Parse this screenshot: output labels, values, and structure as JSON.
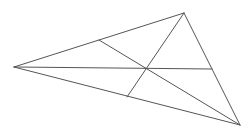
{
  "diagram": {
    "type": "triangle-with-concurrent-cevians",
    "width": 249,
    "height": 130,
    "background": "#ffffff",
    "stroke_color": "#555555",
    "stroke_width": 1,
    "vertices": {
      "A": {
        "x": 14,
        "y": 67
      },
      "B": {
        "x": 184,
        "y": 13
      },
      "C": {
        "x": 240,
        "y": 125
      }
    },
    "cevian_feet": {
      "D_on_AB": {
        "x": 99,
        "y": 40
      },
      "E_on_BC": {
        "x": 212,
        "y": 69
      },
      "F_on_CA": {
        "x": 127,
        "y": 97
      }
    },
    "concurrency_point": {
      "x": 146,
      "y": 68
    },
    "segments": [
      {
        "name": "side-ab",
        "from": "A",
        "to": "B"
      },
      {
        "name": "side-bc",
        "from": "B",
        "to": "C"
      },
      {
        "name": "side-ca",
        "from": "C",
        "to": "A"
      },
      {
        "name": "cevian-a-to-bc",
        "from": "A",
        "to": "E_on_BC"
      },
      {
        "name": "cevian-b-to-ca",
        "from": "B",
        "to": "F_on_CA"
      },
      {
        "name": "cevian-c-to-ab",
        "from": "C",
        "to": "D_on_AB"
      }
    ]
  }
}
